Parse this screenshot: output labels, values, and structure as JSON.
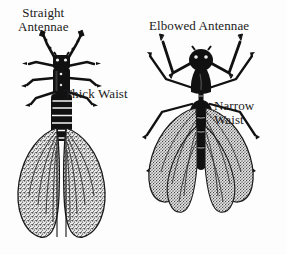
{
  "figure": {
    "background_color": "#fdfdfd",
    "ink_color": "#111111",
    "wing_fill_color": "#9b9b9b"
  },
  "labels": {
    "straight_antennae": {
      "line1": "Straight",
      "line2": "Antennae"
    },
    "thick_waist": {
      "line1": "Thick Waist"
    },
    "elbowed_antennae": {
      "line1": "Elbowed Antennae"
    },
    "narrow_waist": {
      "line1": "Narrow",
      "line2": "Waist"
    }
  },
  "specimens": [
    {
      "id": "termite",
      "position": "left",
      "features": [
        "straight-antennae",
        "thick-waist",
        "equal-length-wings",
        "segmented-abdomen",
        "short-legs"
      ]
    },
    {
      "id": "winged-ant",
      "position": "right",
      "features": [
        "elbowed-antennae",
        "narrow-waist",
        "unequal-wings",
        "long-jointed-legs",
        "pinched-petiole"
      ]
    }
  ]
}
